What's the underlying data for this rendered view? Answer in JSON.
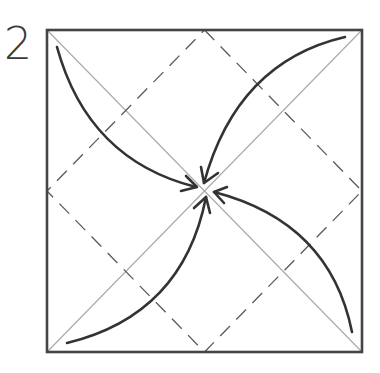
{
  "step": {
    "number": "2"
  },
  "diagram": {
    "type": "origami-fold-step",
    "square": {
      "x": 47,
      "y": 30,
      "width": 315,
      "height": 322
    },
    "center": {
      "x": 204.5,
      "y": 191
    },
    "lines": {
      "border_color": "#444444",
      "diagonal_color": "#aaaaaa",
      "valley_fold_color": "#555555",
      "arrow_color": "#333333"
    },
    "creases": [
      {
        "kind": "diagonal",
        "from": "top-left",
        "to": "bottom-right"
      },
      {
        "kind": "diagonal",
        "from": "top-right",
        "to": "bottom-left"
      },
      {
        "kind": "valley-fold",
        "shape": "diamond",
        "vertices": [
          "top-mid",
          "right-mid",
          "bottom-mid",
          "left-mid"
        ]
      }
    ],
    "arrows": [
      {
        "from": "top-left-corner",
        "to": "center"
      },
      {
        "from": "top-right-corner",
        "to": "center"
      },
      {
        "from": "bottom-right-corner",
        "to": "center"
      },
      {
        "from": "bottom-left-corner",
        "to": "center"
      }
    ],
    "instruction": "Fold all four corners to the center"
  }
}
